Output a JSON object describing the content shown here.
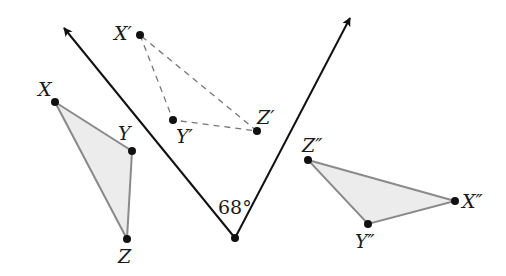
{
  "diagram": {
    "type": "reflection-composition",
    "colors": {
      "line": "#111111",
      "triangle_stroke": "#8a8a8a",
      "triangle_fill": "#ececec",
      "dashed": "#777777",
      "point": "#111111"
    },
    "angle": {
      "label": "68°",
      "vertex": [
        235,
        238
      ],
      "ray_left_tip": [
        63,
        27
      ],
      "ray_right_tip": [
        351,
        17
      ]
    },
    "triangles": {
      "original": {
        "style": "filled",
        "points": {
          "X": [
            55,
            102
          ],
          "Y": [
            132,
            151
          ],
          "Z": [
            127,
            239
          ]
        },
        "labels": {
          "X": "X",
          "Y": "Y",
          "Z": "Z"
        }
      },
      "first_image": {
        "style": "dashed",
        "points": {
          "X": [
            140,
            35
          ],
          "Y": [
            173,
            120
          ],
          "Z": [
            257,
            131
          ]
        },
        "labels": {
          "X": "X′",
          "Y": "Y′",
          "Z": "Z′"
        }
      },
      "second_image": {
        "style": "filled",
        "points": {
          "Z": [
            308,
            160
          ],
          "X": [
            455,
            201
          ],
          "Y": [
            368,
            224
          ]
        },
        "labels": {
          "X": "X″",
          "Y": "Y″",
          "Z": "Z″"
        }
      }
    }
  }
}
